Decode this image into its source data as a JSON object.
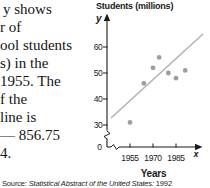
{
  "left_text": {
    "lines": [
      "y shows",
      "r of",
      "ool students",
      "s) in the",
      "1955. The",
      "f the",
      "line is",
      "— 856.75",
      "4."
    ]
  },
  "chart": {
    "title": "Students (millions)",
    "y_axis_symbol": "y",
    "x_axis_symbol": "x",
    "x_label": "Years",
    "origin_label": "0",
    "y_ticks": [
      "30",
      "40",
      "50",
      "60"
    ],
    "x_ticks": [
      "1955",
      "1970",
      "1985"
    ]
  },
  "source": {
    "prefix": "Source: ",
    "italic": "Statistical Abstract of the United States: ",
    "year": "1992"
  },
  "chart_data": {
    "type": "scatter",
    "title": "Students (millions)",
    "xlabel": "Years",
    "ylabel": "Students (millions)",
    "x_tick_values": [
      1955,
      1970,
      1985
    ],
    "y_tick_values": [
      0,
      30,
      40,
      50,
      60
    ],
    "axis_breaks": true,
    "xlim": [
      1950,
      1995
    ],
    "ylim": [
      0,
      68
    ],
    "points": [
      {
        "x": 1955,
        "y": 31
      },
      {
        "x": 1964,
        "y": 46
      },
      {
        "x": 1970,
        "y": 52
      },
      {
        "x": 1974,
        "y": 56
      },
      {
        "x": 1980,
        "y": 50
      },
      {
        "x": 1985,
        "y": 48
      },
      {
        "x": 1991,
        "y": 51
      }
    ],
    "trend_line": {
      "x1": 1942.6,
      "y1": 32.7,
      "x2": 2002.6,
      "y2": 65,
      "equation_fragment": "— 856.75"
    },
    "colors": {
      "point": "#9e9e9e",
      "line": "#b3b3b3",
      "axis": "#1a1a1a",
      "text": "#191919"
    }
  }
}
